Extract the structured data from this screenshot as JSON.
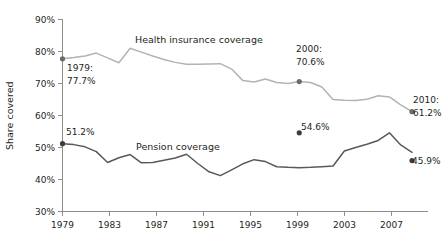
{
  "chart_data": {
    "type": "line",
    "title": "",
    "subtitle": "",
    "xlabel": "",
    "ylabel": "Share covered",
    "xlim": [
      1979,
      2010
    ],
    "ylim": [
      30,
      90
    ],
    "grid": false,
    "legend_position": "inline-labels",
    "y_ticks": [
      "30%",
      "40%",
      "50%",
      "60%",
      "70%",
      "80%",
      "90%"
    ],
    "y_tick_values": [
      30,
      40,
      50,
      60,
      70,
      80,
      90
    ],
    "x_ticks": [
      "1979",
      "1983",
      "1987",
      "1991",
      "1995",
      "1999",
      "2003",
      "2007"
    ],
    "x_tick_values": [
      1979,
      1983,
      1987,
      1991,
      1995,
      1999,
      2003,
      2007
    ],
    "x": [
      1979,
      1980,
      1981,
      1982,
      1983,
      1984,
      1985,
      1986,
      1987,
      1988,
      1989,
      1990,
      1991,
      1992,
      1993,
      1994,
      1995,
      1996,
      1997,
      1998,
      1999,
      2000,
      2001,
      2002,
      2003,
      2004,
      2005,
      2006,
      2007,
      2008,
      2009,
      2010
    ],
    "series": [
      {
        "name": "Health insurance coverage",
        "label": "Health insurance coverage",
        "color": "#b3b3b3",
        "values": [
          77.7,
          78.1,
          78.6,
          79.5,
          78.0,
          76.5,
          81.0,
          79.8,
          78.6,
          77.5,
          76.6,
          76.0,
          76.0,
          76.1,
          76.2,
          74.5,
          70.9,
          70.5,
          71.4,
          70.3,
          70.0,
          70.6,
          70.3,
          68.9,
          65.0,
          64.8,
          64.7,
          65.1,
          66.2,
          65.8,
          63.3,
          61.2
        ]
      },
      {
        "name": "Pension coverage",
        "label": "Pension coverage",
        "color": "#595959",
        "values": [
          51.2,
          50.9,
          50.2,
          48.7,
          45.3,
          46.8,
          47.8,
          45.2,
          45.3,
          46.0,
          46.7,
          47.9,
          45.0,
          42.4,
          41.2,
          43.0,
          44.9,
          46.2,
          45.6,
          44.0,
          43.8,
          43.7,
          43.8,
          44.0,
          44.2,
          48.9,
          50.0,
          51.0,
          52.2,
          54.6,
          50.8,
          48.5
        ]
      }
    ],
    "annotations": [
      {
        "id": "health-start",
        "series": "Health insurance coverage",
        "year_label": "1979:",
        "value_label": "77.7%",
        "x": 1979,
        "y": 77.7,
        "marker": true
      },
      {
        "id": "health-2000",
        "series": "Health insurance coverage",
        "year_label": "2000:",
        "value_label": "70.6%",
        "x": 2000,
        "y": 70.6,
        "marker": true
      },
      {
        "id": "health-end",
        "series": "Health insurance coverage",
        "year_label": "2010:",
        "value_label": "61.2%",
        "x": 2010,
        "y": 61.2,
        "marker": true
      },
      {
        "id": "pension-start",
        "series": "Pension coverage",
        "year_label": "",
        "value_label": "51.2%",
        "x": 1979,
        "y": 51.2,
        "marker": true
      },
      {
        "id": "pension-peak",
        "series": "Pension coverage",
        "year_label": "",
        "value_label": "54.6%",
        "x": 2000,
        "y": 54.6,
        "marker": true
      },
      {
        "id": "pension-end",
        "series": "Pension coverage",
        "year_label": "",
        "value_label": "45.9%",
        "x": 2010,
        "y": 45.9,
        "marker": true
      }
    ]
  },
  "axis": {
    "ylabel": "Share covered",
    "y_tick_0": "30%",
    "y_tick_1": "40%",
    "y_tick_2": "50%",
    "y_tick_3": "60%",
    "y_tick_4": "70%",
    "y_tick_5": "80%",
    "y_tick_6": "90%",
    "x_tick_0": "1979",
    "x_tick_1": "1983",
    "x_tick_2": "1987",
    "x_tick_3": "1991",
    "x_tick_4": "1995",
    "x_tick_5": "1999",
    "x_tick_6": "2003",
    "x_tick_7": "2007"
  },
  "labels": {
    "health_series": "Health insurance coverage",
    "pension_series": "Pension coverage",
    "health_start_year": "1979:",
    "health_start_value": "77.7%",
    "health_2000_year": "2000:",
    "health_2000_value": "70.6%",
    "health_end_year": "2010:",
    "health_end_value": "61.2%",
    "pension_start_value": "51.2%",
    "pension_peak_value": "54.6%",
    "pension_end_value": "45.9%"
  },
  "colors": {
    "health_line": "#b3b3b3",
    "pension_line": "#595959",
    "axis": "#8d8d8d",
    "text": "#231f20",
    "background": "#ffffff"
  }
}
